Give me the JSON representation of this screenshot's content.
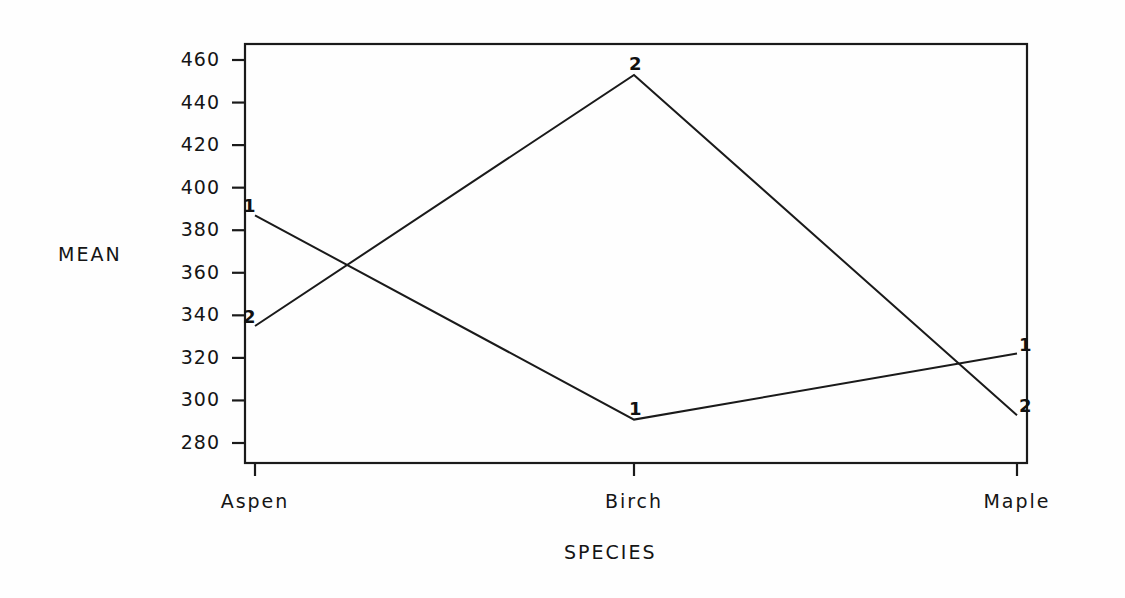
{
  "chart_data": {
    "type": "line",
    "title": "",
    "xlabel": "SPECIES",
    "ylabel": "MEAN",
    "categories": [
      "Aspen",
      "Birch",
      "Maple"
    ],
    "ylim": [
      270,
      470
    ],
    "yticks": [
      280,
      300,
      320,
      340,
      360,
      380,
      400,
      420,
      440,
      460
    ],
    "ytick_labels": [
      "280",
      "300",
      "320",
      "340",
      "360",
      "380",
      "400",
      "420",
      "440",
      "460"
    ],
    "grid": false,
    "legend": "point-labels",
    "series": [
      {
        "name": "1",
        "marker_label": "1",
        "values": [
          387,
          291,
          322
        ]
      },
      {
        "name": "2",
        "marker_label": "2",
        "values": [
          335,
          453,
          293
        ]
      }
    ],
    "line_color": "#1a1a1a",
    "frame_color": "#1a1a1a",
    "background": "#ffffff"
  },
  "axis": {
    "y_title": "MEAN",
    "x_title": "SPECIES"
  }
}
